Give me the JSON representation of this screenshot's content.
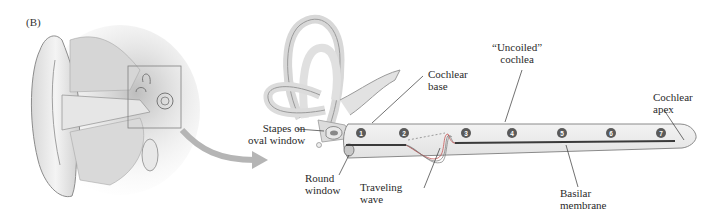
{
  "figure": {
    "panel_label": "(B)",
    "labels": {
      "stapes": "Stapes on\noval window",
      "round_window": "Round\nwindow",
      "cochlear_base": "Cochlear\nbase",
      "traveling_wave": "Traveling\nwave",
      "uncoiled_cochlea": "“Uncoiled”\ncochlea",
      "basilar_membrane": "Basilar\nmembrane",
      "cochlear_apex": "Cochlear\napex"
    },
    "positions": [
      "1",
      "2",
      "3",
      "4",
      "5",
      "6",
      "7"
    ],
    "colors": {
      "tube_fill": "#ebebeb",
      "tube_stroke": "#8a8a8a",
      "membrane": "#3a3a3a",
      "marker": "#5a5a5a",
      "arrow": "#b5b5b5"
    }
  }
}
